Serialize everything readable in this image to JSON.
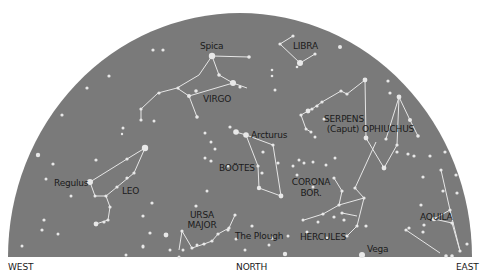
{
  "sky": {
    "background_color": "#7a7a7a",
    "star_color": "#e8e8e8",
    "line_color": "#e6e6e6",
    "dome": {
      "cx": 240,
      "cy": 257,
      "rx": 232,
      "ry": 244
    }
  },
  "directions": {
    "west": "WEST",
    "north": "NORTH",
    "east": "EAST"
  },
  "labels": {
    "spica": "Spica",
    "libra": "LIBRA",
    "virgo": "VIRGO",
    "serpens": "SERPENS",
    "serpens_sub": "(Caput)",
    "ophiuchus": "OPHIUCHUS",
    "arcturus": "Arcturus",
    "bootes": "BOÖTES",
    "corona": "CORONA",
    "corona_sub": "BOR.",
    "regulus": "Regulus",
    "leo": "LEO",
    "ursa": "URSA",
    "ursa_sub": "MAJOR",
    "plough": "The Plough",
    "hercules": "HERCULES",
    "vega": "Vega",
    "aquila": "AQUILA"
  },
  "stars": [
    [
      212,
      56,
      3.2
    ],
    [
      249,
      57,
      1.8
    ],
    [
      219,
      75,
      1.8
    ],
    [
      233,
      83,
      3.0
    ],
    [
      240,
      87,
      1.6
    ],
    [
      196,
      91,
      1.8
    ],
    [
      178,
      88,
      1.6
    ],
    [
      189,
      96,
      2.0
    ],
    [
      159,
      93,
      1.6
    ],
    [
      141,
      109,
      1.6
    ],
    [
      141,
      120,
      1.6
    ],
    [
      154,
      121,
      1.5
    ],
    [
      197,
      117,
      1.8
    ],
    [
      153,
      50,
      1.6
    ],
    [
      163,
      50,
      1.6
    ],
    [
      109,
      76,
      1.6
    ],
    [
      87,
      88,
      1.6
    ],
    [
      62,
      115,
      1.6
    ],
    [
      123,
      128,
      1.5
    ],
    [
      205,
      133,
      1.5
    ],
    [
      230,
      127,
      1.6
    ],
    [
      236,
      132,
      2.8
    ],
    [
      122,
      134,
      1.2
    ],
    [
      280,
      44,
      1.6
    ],
    [
      293,
      36,
      1.6
    ],
    [
      300,
      63,
      3.0
    ],
    [
      315,
      54,
      1.6
    ],
    [
      340,
      47,
      2.0
    ],
    [
      297,
      67,
      1.3
    ],
    [
      272,
      70,
      1.3
    ],
    [
      272,
      76,
      1.3
    ],
    [
      275,
      90,
      1.5
    ],
    [
      365,
      80,
      2.4
    ],
    [
      347,
      94,
      1.6
    ],
    [
      341,
      91,
      1.6
    ],
    [
      322,
      102,
      1.6
    ],
    [
      317,
      106,
      1.6
    ],
    [
      308,
      111,
      2.4
    ],
    [
      301,
      115,
      1.6
    ],
    [
      312,
      109,
      1.6
    ],
    [
      324,
      119,
      1.5
    ],
    [
      306,
      129,
      1.5
    ],
    [
      311,
      132,
      1.5
    ],
    [
      315,
      137,
      1.5
    ],
    [
      388,
      81,
      1.6
    ],
    [
      390,
      93,
      1.6
    ],
    [
      399,
      97,
      2.4
    ],
    [
      410,
      120,
      2.0
    ],
    [
      418,
      136,
      1.8
    ],
    [
      366,
      138,
      2.4
    ],
    [
      386,
      139,
      1.6
    ],
    [
      397,
      145,
      1.6
    ],
    [
      397,
      152,
      1.6
    ],
    [
      408,
      154,
      1.6
    ],
    [
      414,
      156,
      1.6
    ],
    [
      430,
      156,
      1.6
    ],
    [
      384,
      168,
      2.4
    ],
    [
      445,
      152,
      1.6
    ],
    [
      423,
      177,
      1.6
    ],
    [
      456,
      175,
      1.6
    ],
    [
      246,
      135,
      2.8
    ],
    [
      273,
      145,
      1.6
    ],
    [
      263,
      152,
      1.6
    ],
    [
      278,
      163,
      1.6
    ],
    [
      258,
      166,
      1.6
    ],
    [
      262,
      173,
      1.6
    ],
    [
      259,
      188,
      2.2
    ],
    [
      281,
      196,
      2.4
    ],
    [
      211,
      142,
      1.5
    ],
    [
      215,
      149,
      1.5
    ],
    [
      205,
      158,
      1.5
    ],
    [
      228,
      166,
      1.5
    ],
    [
      299,
      160,
      1.5
    ],
    [
      304,
      163,
      1.5
    ],
    [
      313,
      162,
      1.5
    ],
    [
      293,
      166,
      1.5
    ],
    [
      297,
      175,
      1.5
    ],
    [
      313,
      187,
      1.5
    ],
    [
      326,
      165,
      1.5
    ],
    [
      335,
      158,
      1.5
    ],
    [
      334,
      178,
      1.6
    ],
    [
      342,
      191,
      1.6
    ],
    [
      355,
      188,
      1.6
    ],
    [
      339,
      205,
      1.6
    ],
    [
      364,
      198,
      1.6
    ],
    [
      323,
      214,
      1.6
    ],
    [
      334,
      217,
      1.6
    ],
    [
      342,
      213,
      1.6
    ],
    [
      344,
      220,
      1.6
    ],
    [
      303,
      220,
      1.5
    ],
    [
      318,
      222,
      1.5
    ],
    [
      357,
      226,
      1.6
    ],
    [
      366,
      226,
      1.6
    ],
    [
      347,
      236,
      1.6
    ],
    [
      362,
      255,
      3.0
    ],
    [
      307,
      232,
      1.5
    ],
    [
      288,
      236,
      1.5
    ],
    [
      327,
      238,
      1.5
    ],
    [
      443,
      191,
      1.6
    ],
    [
      457,
      193,
      1.6
    ],
    [
      441,
      170,
      1.6
    ],
    [
      421,
      205,
      1.6
    ],
    [
      450,
      210,
      1.6
    ],
    [
      434,
      219,
      2.2
    ],
    [
      424,
      225,
      1.6
    ],
    [
      409,
      228,
      1.6
    ],
    [
      406,
      230,
      1.6
    ],
    [
      452,
      223,
      1.6
    ],
    [
      467,
      244,
      1.6
    ],
    [
      460,
      251,
      1.6
    ],
    [
      446,
      256,
      1.8
    ],
    [
      452,
      256,
      1.8
    ],
    [
      423,
      232,
      1.6
    ],
    [
      145,
      148,
      3.2
    ],
    [
      127,
      159,
      1.6
    ],
    [
      134,
      173,
      1.6
    ],
    [
      127,
      178,
      1.6
    ],
    [
      117,
      187,
      1.6
    ],
    [
      90,
      182,
      3.0
    ],
    [
      95,
      196,
      1.5
    ],
    [
      106,
      196,
      1.6
    ],
    [
      110,
      207,
      1.6
    ],
    [
      108,
      220,
      1.6
    ],
    [
      104,
      222,
      1.6
    ],
    [
      96,
      224,
      2.4
    ],
    [
      38,
      155,
      2.2
    ],
    [
      53,
      164,
      1.6
    ],
    [
      46,
      179,
      1.5
    ],
    [
      71,
      196,
      1.5
    ],
    [
      44,
      220,
      1.6
    ],
    [
      42,
      230,
      1.6
    ],
    [
      58,
      234,
      1.5
    ],
    [
      96,
      160,
      1.6
    ],
    [
      152,
      203,
      1.6
    ],
    [
      143,
      216,
      1.6
    ],
    [
      150,
      233,
      1.6
    ],
    [
      166,
      235,
      2.4
    ],
    [
      182,
      231,
      1.6
    ],
    [
      196,
      206,
      1.6
    ],
    [
      211,
      161,
      1.6
    ],
    [
      207,
      191,
      1.5
    ],
    [
      228,
      230,
      1.6
    ],
    [
      126,
      255,
      1.5
    ],
    [
      143,
      247,
      1.5
    ],
    [
      143,
      246,
      1.5
    ],
    [
      192,
      248,
      1.6
    ],
    [
      204,
      244,
      1.6
    ],
    [
      212,
      241,
      1.6
    ],
    [
      218,
      234,
      1.6
    ],
    [
      229,
      228,
      1.6
    ],
    [
      235,
      215,
      1.6
    ],
    [
      179,
      257,
      1.5
    ],
    [
      183,
      250,
      1.5
    ],
    [
      197,
      245,
      1.5
    ],
    [
      252,
      226,
      1.6
    ],
    [
      272,
      238,
      1.8
    ],
    [
      285,
      254,
      2.2
    ],
    [
      236,
      239,
      1.5
    ],
    [
      245,
      250,
      1.5
    ],
    [
      269,
      245,
      1.5
    ],
    [
      22,
      246,
      1.5
    ],
    [
      170,
      250,
      1.5
    ]
  ],
  "lines": [
    [
      212,
      56,
      249,
      57
    ],
    [
      212,
      56,
      199,
      75
    ],
    [
      212,
      56,
      219,
      75
    ],
    [
      199,
      75,
      177,
      88
    ],
    [
      219,
      75,
      233,
      83
    ],
    [
      233,
      83,
      247,
      88
    ],
    [
      233,
      83,
      189,
      96
    ],
    [
      177,
      88,
      158,
      93
    ],
    [
      177,
      88,
      189,
      96
    ],
    [
      158,
      93,
      141,
      109
    ],
    [
      141,
      109,
      141,
      120
    ],
    [
      189,
      96,
      197,
      117
    ],
    [
      280,
      44,
      293,
      36
    ],
    [
      280,
      44,
      300,
      63
    ],
    [
      300,
      63,
      315,
      54
    ],
    [
      365,
      80,
      347,
      94
    ],
    [
      347,
      94,
      341,
      91
    ],
    [
      341,
      91,
      322,
      102
    ],
    [
      322,
      102,
      312,
      109
    ],
    [
      312,
      109,
      308,
      111
    ],
    [
      308,
      111,
      301,
      115
    ],
    [
      301,
      115,
      306,
      129
    ],
    [
      306,
      129,
      311,
      132
    ],
    [
      365,
      80,
      366,
      138
    ],
    [
      366,
      138,
      384,
      168
    ],
    [
      384,
      168,
      397,
      145
    ],
    [
      397,
      145,
      399,
      97
    ],
    [
      399,
      97,
      410,
      120
    ],
    [
      410,
      120,
      418,
      136
    ],
    [
      399,
      97,
      386,
      139
    ],
    [
      236,
      132,
      246,
      135
    ],
    [
      246,
      135,
      258,
      166
    ],
    [
      246,
      135,
      273,
      145
    ],
    [
      273,
      145,
      281,
      196
    ],
    [
      258,
      166,
      259,
      188
    ],
    [
      259,
      188,
      281,
      196
    ],
    [
      334,
      178,
      342,
      191
    ],
    [
      342,
      191,
      339,
      205
    ],
    [
      339,
      205,
      323,
      214
    ],
    [
      339,
      205,
      364,
      198
    ],
    [
      364,
      198,
      357,
      226
    ],
    [
      357,
      226,
      347,
      236
    ],
    [
      323,
      214,
      304,
      220
    ],
    [
      342,
      213,
      357,
      216
    ],
    [
      355,
      188,
      364,
      198
    ],
    [
      355,
      188,
      366,
      164
    ],
    [
      366,
      164,
      376,
      142
    ],
    [
      441,
      170,
      450,
      210
    ],
    [
      434,
      219,
      450,
      210
    ],
    [
      450,
      210,
      460,
      251
    ],
    [
      434,
      219,
      452,
      223
    ],
    [
      452,
      223,
      460,
      251
    ],
    [
      406,
      230,
      440,
      253
    ],
    [
      145,
      148,
      127,
      159
    ],
    [
      127,
      159,
      90,
      182
    ],
    [
      145,
      148,
      134,
      173
    ],
    [
      134,
      173,
      117,
      187
    ],
    [
      117,
      187,
      106,
      196
    ],
    [
      90,
      182,
      95,
      196
    ],
    [
      95,
      196,
      106,
      196
    ],
    [
      106,
      196,
      110,
      207
    ],
    [
      110,
      207,
      108,
      220
    ],
    [
      108,
      220,
      96,
      224
    ],
    [
      182,
      231,
      192,
      248
    ],
    [
      192,
      248,
      204,
      244
    ],
    [
      204,
      244,
      212,
      241
    ],
    [
      212,
      241,
      218,
      234
    ],
    [
      218,
      234,
      229,
      228
    ],
    [
      229,
      228,
      235,
      215
    ],
    [
      182,
      231,
      179,
      250
    ]
  ]
}
